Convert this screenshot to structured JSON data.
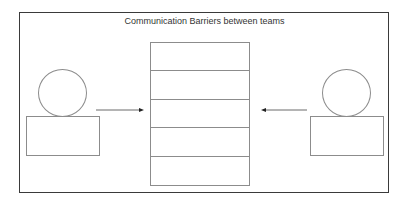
{
  "diagram": {
    "title": "Communication Barriers between teams",
    "left_actor": {
      "label": ""
    },
    "right_actor": {
      "label": ""
    },
    "barrier": {
      "layers": [
        "",
        "",
        "",
        "",
        ""
      ]
    },
    "arrows": [
      {
        "from": "left_actor",
        "to": "barrier",
        "direction": "right"
      },
      {
        "from": "right_actor",
        "to": "barrier",
        "direction": "left"
      }
    ],
    "colors": {
      "frame": "#3a3a3a",
      "shape_stroke": "#8c8c8c",
      "text": "#333333"
    }
  }
}
